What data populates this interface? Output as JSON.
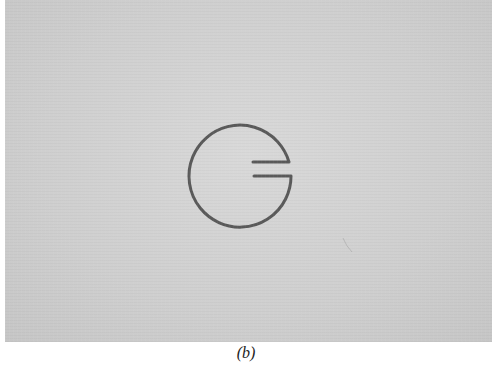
{
  "figure": {
    "caption": "(b)",
    "background_color": "#cfcfcf",
    "stroke_color": "#5a5a5a",
    "shape": "split-ring-resonator-icon"
  }
}
